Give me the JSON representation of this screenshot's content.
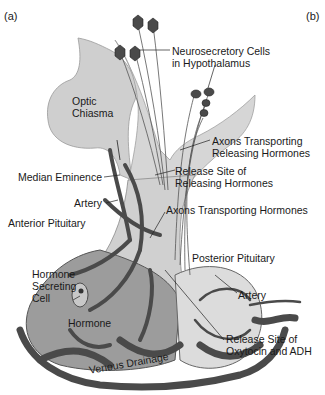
{
  "figure": {
    "panel_labels": {
      "a": "(a)",
      "b": "(b)"
    },
    "labels": {
      "neurosecretory_1": "Neurosecretory Cells",
      "neurosecretory_2": "in Hypothalamus",
      "optic_1": "Optic",
      "optic_2": "Chiasma",
      "axons_rel_1": "Axons Transporting",
      "axons_rel_2": "Releasing Hormones",
      "median_eminence": "Median Eminence",
      "release_site_1": "Release Site of",
      "release_site_2": "Releasing Hormones",
      "artery_1": "Artery",
      "axons_hormones": "Axons Transporting Hormones",
      "anterior_pituitary": "Anterior Pituitary",
      "posterior_pituitary": "Posterior Pituitary",
      "hormone_secreting_1": "Hormone",
      "hormone_secreting_2": "Secreting",
      "hormone_secreting_3": "Cell",
      "hormone": "Hormone",
      "artery_2": "Artery",
      "oxytocin_1": "Release Site of",
      "oxytocin_2": "Oxytocin and ADH",
      "venous_drainage": "Venous Drainage"
    },
    "colors": {
      "tissue": "#c8c8c8",
      "tissue_light": "#dcdcdc",
      "vessel": "#4a4a4a",
      "anterior": "#9a9a9a",
      "text": "#1a1a1a"
    }
  }
}
